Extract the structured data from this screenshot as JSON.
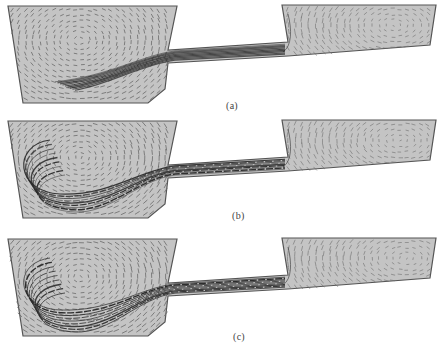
{
  "figure": {
    "panels": [
      {
        "id": "a",
        "label": "(a)",
        "offset_y": 0,
        "label_x": 226,
        "label_y": 100,
        "jet_spread": 0.6,
        "eddy_strength": 0.7,
        "right_eddy_x": 395
      },
      {
        "id": "b",
        "label": "(b)",
        "offset_y": 115,
        "label_x": 232,
        "label_y": 210,
        "jet_spread": 0.9,
        "eddy_strength": 1.0,
        "right_eddy_x": 400
      },
      {
        "id": "c",
        "label": "(c)",
        "offset_y": 233,
        "label_x": 233,
        "label_y": 331,
        "jet_spread": 1.1,
        "eddy_strength": 1.1,
        "right_eddy_x": 405
      }
    ],
    "colors": {
      "fill": "#c4c4c4",
      "outline": "#555555",
      "vector": "#6a6a6a",
      "jet": "#2a2a2a"
    }
  }
}
